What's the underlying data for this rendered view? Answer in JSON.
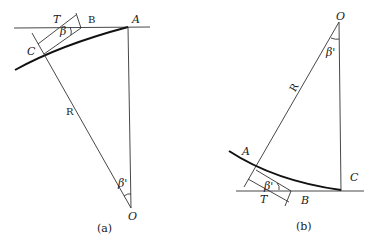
{
  "figure_a": {
    "caption": "(a)",
    "labels": {
      "T": "T",
      "B": "B",
      "A": "A",
      "C": "C",
      "beta_small": "β",
      "R": "R",
      "beta_prime": "β'",
      "O": "O"
    }
  },
  "figure_b": {
    "caption": "(b)",
    "labels": {
      "O": "O",
      "beta_prime_top": "β'",
      "R": "R",
      "A": "A",
      "C": "C",
      "beta_prime_small": "β'",
      "T": "T",
      "B": "B"
    }
  }
}
